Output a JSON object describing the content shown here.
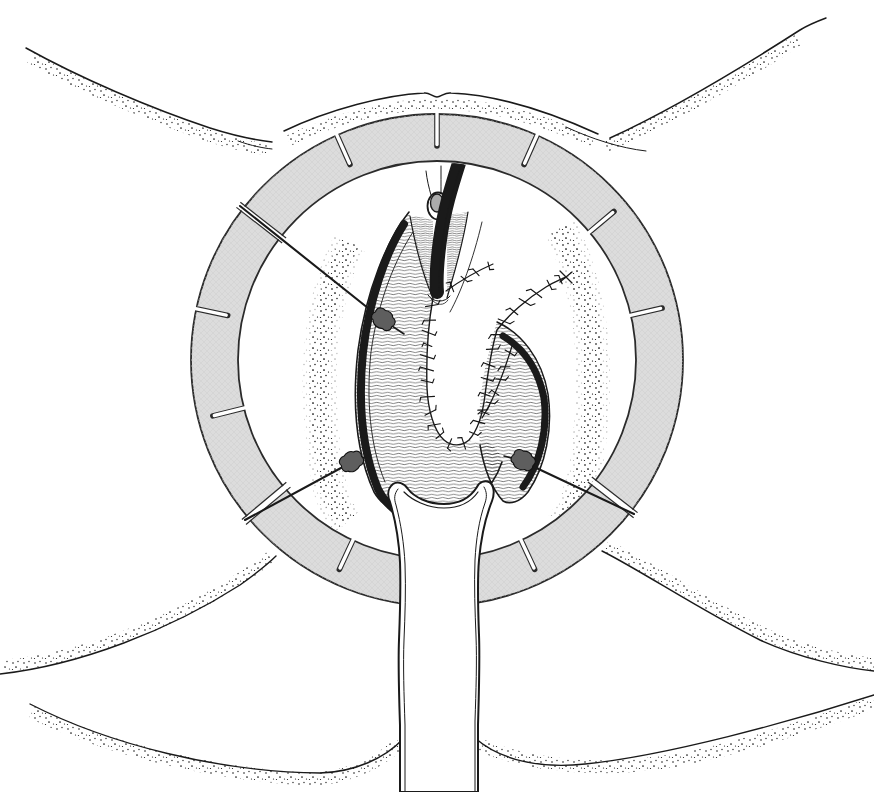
{
  "meta": {
    "figure_type": "medical line illustration",
    "text_content_present": false
  },
  "colors": {
    "background": "#ffffff",
    "ink": "#1a1a1a",
    "ring_fill": "#dcdcdc",
    "ring_outline": "#2b2b2b",
    "ring_texture": "#c9c9c9",
    "hook_fill": "#5e5e5e",
    "stay_line": "#111111",
    "stipple": "#161616",
    "hatch": "#1c1c1c",
    "glans_inner": "#ababab"
  },
  "components": {
    "retractor_ring": "segmented circular retractor ring with notches",
    "ring_gaps": "three radial joint gaps where elastic stays cross",
    "stays": "three elastic stay lines with tissue hooks",
    "catheter": "urinary catheter entering field from top",
    "glans": "glans with inner ring",
    "suture_u": "U-shaped running suture line around central opening",
    "suture_diagonal": "diagonal suture line to upper right",
    "suture_flap_edge": "medial flap edge suture",
    "left_flap": "hatched left tissue flap",
    "right_flap": "hatched right tissue flap",
    "stent": "flared vaginal stent tube at bottom",
    "skin_folds": "stippled groin and gluteal skin folds"
  }
}
